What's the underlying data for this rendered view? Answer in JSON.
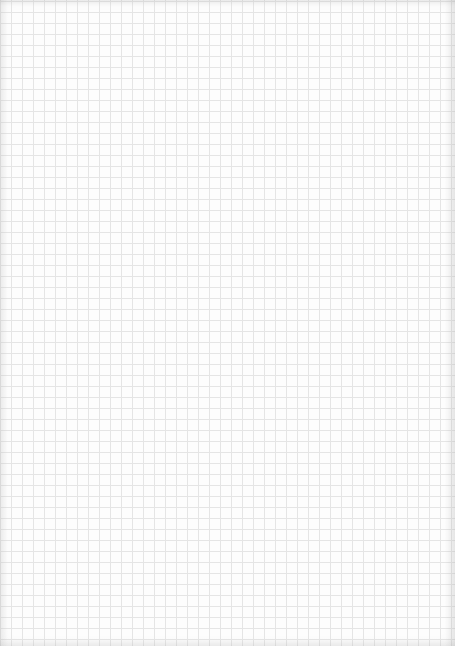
{
  "sheet": {
    "type": "graph-paper",
    "background_color": "#fdfdfd",
    "grid_line_color": "#e3e3e3",
    "grid_spacing_px": 11
  }
}
